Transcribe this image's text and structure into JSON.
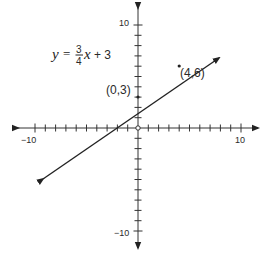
{
  "figure": {
    "equation": {
      "lhs": "y",
      "equals": "=",
      "numerator": "3",
      "denominator": "4",
      "variable": "x",
      "rest": "+ 3"
    },
    "axes": {
      "x_min_label": "−10",
      "x_max_label": "10",
      "y_max_label": "10",
      "y_min_label": "−10"
    },
    "points": [
      {
        "label": "(0,3)",
        "x": 0,
        "y": 3
      },
      {
        "label": "(4,6)",
        "x": 4,
        "y": 6
      }
    ],
    "colors": {
      "axis": "#333333",
      "line": "#222222",
      "text": "#2a2a2a"
    }
  },
  "chart_data": {
    "type": "line",
    "xlabel": "",
    "ylabel": "",
    "xlim": [
      -10,
      10
    ],
    "ylim": [
      -10,
      10
    ],
    "grid": false,
    "series": [
      {
        "name": "y = 3/4x + 3",
        "x": [
          -9.3,
          8
        ],
        "y": [
          -4,
          9
        ],
        "arrows": "both"
      }
    ],
    "annotations": [
      {
        "text": "(0,3)",
        "x": 0,
        "y": 3
      },
      {
        "text": "(4,6)",
        "x": 4,
        "y": 6
      }
    ],
    "tick_labels": {
      "x": [
        "-10",
        "10"
      ],
      "y": [
        "10",
        "-10"
      ]
    }
  }
}
